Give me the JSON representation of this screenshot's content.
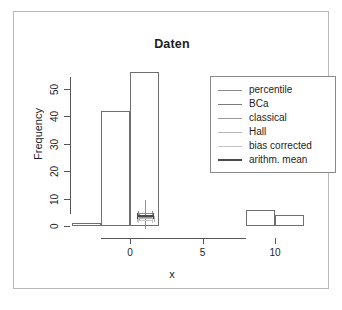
{
  "figure": {
    "title": "Daten",
    "caption": ""
  },
  "axes": {
    "x_title": "x",
    "y_title": "Frequency",
    "x_ticks": [
      "0",
      "5",
      "10"
    ],
    "y_ticks": [
      "0",
      "10",
      "20",
      "30",
      "40",
      "50"
    ]
  },
  "legend": {
    "entries": [
      {
        "label": "percentile",
        "color": "#8a8a8a",
        "width": 1
      },
      {
        "label": "BCa",
        "color": "#7a7a7a",
        "width": 1.5
      },
      {
        "label": "classical",
        "color": "#9a9a9a",
        "width": 1
      },
      {
        "label": "Hall",
        "color": "#b4b4b4",
        "width": 1
      },
      {
        "label": "bias corrected",
        "color": "#c6c6c6",
        "width": 1
      },
      {
        "label": "arithm. mean",
        "color": "#4a4a4a",
        "width": 2.5
      }
    ]
  },
  "chart_data": {
    "type": "bar",
    "title": "Daten",
    "xlabel": "x",
    "ylabel": "Frequency",
    "xlim": [
      -4,
      12
    ],
    "ylim": [
      0,
      58
    ],
    "grid": false,
    "legend_position": "top-right",
    "bin_width": 2,
    "bins": [
      {
        "x0": -4,
        "x1": -2,
        "value": 1
      },
      {
        "x0": -2,
        "x1": 0,
        "value": 42
      },
      {
        "x0": 0,
        "x1": 2,
        "value": 56
      },
      {
        "x0": 2,
        "x1": 4,
        "value": 0
      },
      {
        "x0": 4,
        "x1": 6,
        "value": 0
      },
      {
        "x0": 6,
        "x1": 8,
        "value": 0
      },
      {
        "x0": 8,
        "x1": 10,
        "value": 6
      },
      {
        "x0": 10,
        "x1": 12,
        "value": 4
      }
    ],
    "intervals": [
      {
        "name": "percentile",
        "lower": 0.55,
        "upper": 1.55,
        "y": 4.6,
        "color": "#8a8a8a",
        "width": 1
      },
      {
        "name": "BCa",
        "lower": 0.5,
        "upper": 1.6,
        "y": 4.0,
        "color": "#7a7a7a",
        "width": 1.5
      },
      {
        "name": "classical",
        "lower": 0.6,
        "upper": 1.5,
        "y": 3.4,
        "color": "#9a9a9a",
        "width": 1
      },
      {
        "name": "Hall",
        "lower": 0.45,
        "upper": 1.65,
        "y": 2.8,
        "color": "#b4b4b4",
        "width": 1
      },
      {
        "name": "bias corrected",
        "lower": 0.58,
        "upper": 1.52,
        "y": 2.2,
        "color": "#c6c6c6",
        "width": 1
      }
    ],
    "mean": {
      "name": "arithm. mean",
      "value": 1.05,
      "y_low": -1.2,
      "y_high": 9.5,
      "color": "#8f8f8f"
    }
  }
}
